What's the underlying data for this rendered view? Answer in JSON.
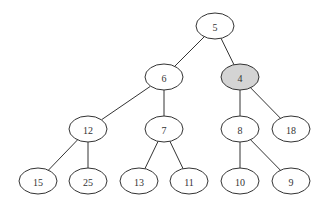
{
  "diagram": {
    "type": "tree",
    "colors": {
      "default_fill": "#ffffff",
      "highlight_fill": "#d4d4d4",
      "stroke": "#333333"
    },
    "nodes": [
      {
        "id": "n5",
        "label": "5",
        "x": 215,
        "y": 26,
        "highlight": false
      },
      {
        "id": "n6",
        "label": "6",
        "x": 164,
        "y": 77,
        "highlight": false
      },
      {
        "id": "n4",
        "label": "4",
        "x": 240,
        "y": 77,
        "highlight": true
      },
      {
        "id": "n12",
        "label": "12",
        "x": 88,
        "y": 129,
        "highlight": false
      },
      {
        "id": "n7",
        "label": "7",
        "x": 164,
        "y": 129,
        "highlight": false
      },
      {
        "id": "n8",
        "label": "8",
        "x": 240,
        "y": 129,
        "highlight": false
      },
      {
        "id": "n18",
        "label": "18",
        "x": 291,
        "y": 129,
        "highlight": false
      },
      {
        "id": "n15",
        "label": "15",
        "x": 38,
        "y": 181,
        "highlight": false
      },
      {
        "id": "n25",
        "label": "25",
        "x": 88,
        "y": 181,
        "highlight": false
      },
      {
        "id": "n13",
        "label": "13",
        "x": 139,
        "y": 181,
        "highlight": false
      },
      {
        "id": "n11",
        "label": "11",
        "x": 189,
        "y": 181,
        "highlight": false
      },
      {
        "id": "n10",
        "label": "10",
        "x": 240,
        "y": 181,
        "highlight": false
      },
      {
        "id": "n9",
        "label": "9",
        "x": 291,
        "y": 181,
        "highlight": false
      }
    ],
    "edges": [
      [
        "n5",
        "n6"
      ],
      [
        "n5",
        "n4"
      ],
      [
        "n6",
        "n12"
      ],
      [
        "n6",
        "n7"
      ],
      [
        "n4",
        "n8"
      ],
      [
        "n4",
        "n18"
      ],
      [
        "n12",
        "n15"
      ],
      [
        "n12",
        "n25"
      ],
      [
        "n7",
        "n13"
      ],
      [
        "n7",
        "n11"
      ],
      [
        "n8",
        "n10"
      ],
      [
        "n8",
        "n9"
      ]
    ]
  }
}
